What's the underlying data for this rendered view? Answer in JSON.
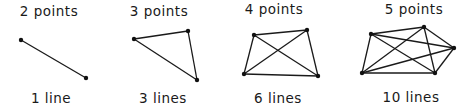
{
  "panels": [
    {
      "top_label": "2 points",
      "bottom_label": "1 line",
      "top_x": 49,
      "bottom_x": 51,
      "points": [
        [
          21,
          40
        ],
        [
          86,
          78
        ]
      ]
    },
    {
      "top_label": "3 points",
      "bottom_label": "3 lines",
      "top_x": 159,
      "bottom_x": 163,
      "points": [
        [
          134,
          39
        ],
        [
          188,
          31
        ],
        [
          197,
          80
        ]
      ]
    },
    {
      "top_label": "4 points",
      "bottom_label": "6 lines",
      "top_x": 274,
      "bottom_x": 278,
      "points": [
        [
          254,
          35
        ],
        [
          307,
          30
        ],
        [
          244,
          74
        ],
        [
          318,
          76
        ]
      ]
    },
    {
      "top_label": "5 points",
      "bottom_label": "10 lines",
      "top_x": 414,
      "bottom_x": 411,
      "points": [
        [
          371,
          34
        ],
        [
          424,
          27
        ],
        [
          454,
          48
        ],
        [
          362,
          73
        ],
        [
          435,
          73
        ]
      ]
    }
  ],
  "style": {
    "stroke": "#1a1a1a",
    "point_color": "#111111"
  }
}
